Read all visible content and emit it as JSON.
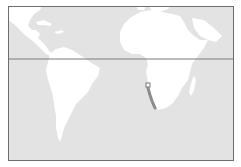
{
  "map": {
    "region": "Atlantic Ocean (Americas and Africa)",
    "colors": {
      "ocean": "#e3e3e3",
      "land": "#ffffff",
      "frame": "#6e6e6e",
      "equator": "#7a7a7a",
      "track": "#8c8c8c",
      "marker": "#7a7a7a"
    },
    "equator_line": true,
    "marker": {
      "shape": "hollow-square",
      "x": 148,
      "y": 85
    },
    "track": {
      "points": [
        [
          148,
          88
        ],
        [
          150,
          95
        ],
        [
          152,
          101
        ],
        [
          155,
          108
        ]
      ]
    }
  }
}
